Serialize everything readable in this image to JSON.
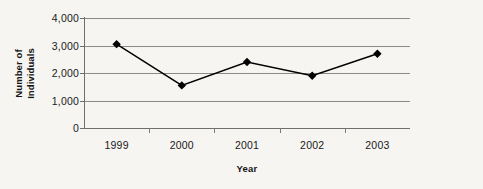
{
  "chart_data": {
    "type": "line",
    "title": "",
    "xlabel": "Year",
    "ylabel_line1": "Number of",
    "ylabel_line2": "Individuals",
    "ylabel": "Number of Individuals",
    "categories": [
      "1999",
      "2000",
      "2001",
      "2002",
      "2003"
    ],
    "values": [
      3050,
      1550,
      2400,
      1900,
      2700
    ],
    "series": [
      {
        "name": "Number of Individuals",
        "values": [
          3050,
          1550,
          2400,
          1900,
          2700
        ]
      }
    ],
    "ylim": [
      0,
      4000
    ],
    "ytick_values": [
      4000,
      3000,
      2000,
      1000,
      0
    ],
    "ytick_labels": [
      "4,000",
      "3,000",
      "2,000",
      "1,000",
      "0"
    ],
    "grid": true,
    "legend": "none",
    "marker": "diamond",
    "colors": {
      "line": "#000000",
      "marker": "#000000",
      "grid": "#8a8a8a",
      "axis": "#6e6e6e",
      "background": "#f6f5f1",
      "text": "#1a1a1a"
    }
  }
}
